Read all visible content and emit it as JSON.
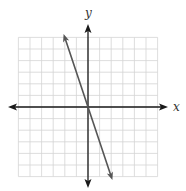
{
  "chart_data": {
    "type": "line",
    "title": "",
    "xlabel": "x",
    "ylabel": "y",
    "xlim": [
      -6,
      6
    ],
    "ylim": [
      -6,
      6
    ],
    "grid": true,
    "grid_step": 1,
    "legend": null,
    "series": [
      {
        "name": "line",
        "equation": "y = -3x",
        "x": [
          -2,
          2
        ],
        "y": [
          6,
          -6
        ],
        "arrows": "both",
        "color": "#555555"
      }
    ]
  },
  "colors": {
    "grid": "#d4d4d4",
    "axis": "#1a1a1a",
    "line": "#555555",
    "background": "#ffffff"
  },
  "labels": {
    "x_axis": "x",
    "y_axis": "y"
  }
}
